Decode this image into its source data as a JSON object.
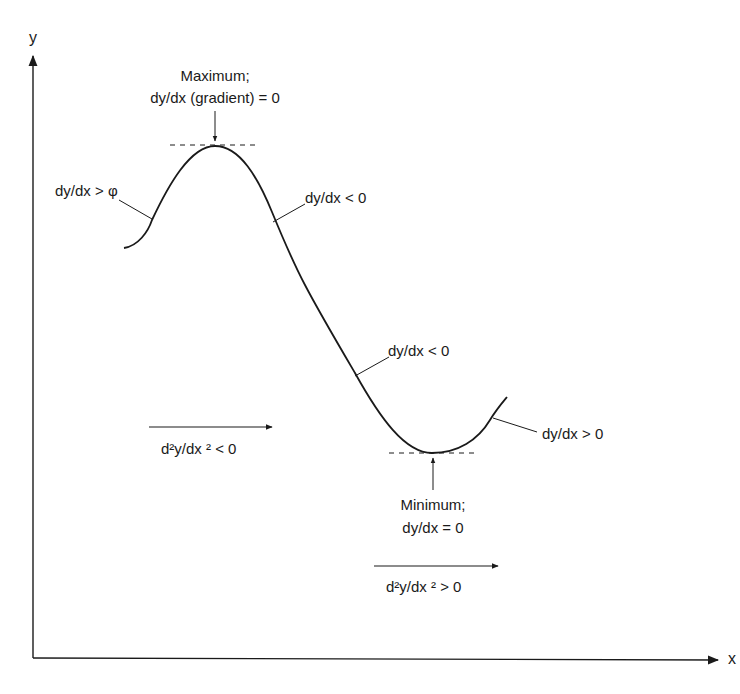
{
  "diagram": {
    "axes": {
      "x_label": "x",
      "y_label": "y"
    },
    "annotations": {
      "maximum": {
        "line1": "Maximum;",
        "line2": "dy/dx (gradient) = 0"
      },
      "rising_left": "dy/dx  > φ",
      "falling_upper": "dy/dx < 0",
      "falling_lower": "dy/dx < 0",
      "rising_right": "dy/dx > 0",
      "minimum": {
        "line1": "Minimum;",
        "line2": "dy/dx = 0"
      },
      "concave_down": "d²y/dx ² < 0",
      "concave_up": "d²y/dx ² > 0"
    },
    "colors": {
      "ink": "#1a1a1a",
      "background": "#ffffff"
    }
  }
}
